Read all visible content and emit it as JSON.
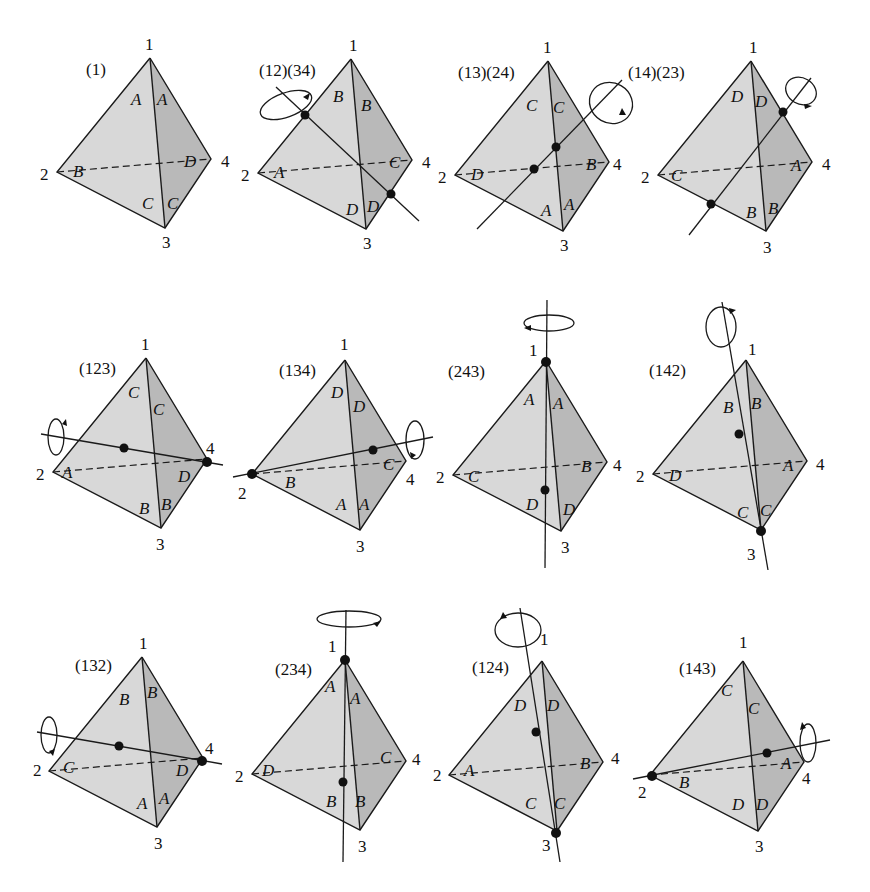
{
  "figure": {
    "vertex_labels": [
      "1",
      "2",
      "3",
      "4"
    ],
    "colors": {
      "left_face": "#d8d8d8",
      "right_face": "#b9b9b9",
      "line": "#1a1a1a",
      "background": "#ffffff"
    },
    "panels": [
      {
        "permutation": "(1)",
        "faces": {
          "upper_left": "A",
          "upper_right": "A",
          "back_left": "B",
          "back_right": "D",
          "lower_left": "C",
          "lower_right": "C"
        },
        "axis": "none"
      },
      {
        "permutation": "(12)(34)",
        "faces": {
          "upper_left": "B",
          "upper_right": "B",
          "back_left": "A",
          "back_right": "C",
          "lower_left": "D",
          "lower_right": "D"
        },
        "axis": "edge-midpoints 12 & 34"
      },
      {
        "permutation": "(13)(24)",
        "faces": {
          "upper_left": "C",
          "upper_right": "C",
          "back_left": "D",
          "back_right": "B",
          "lower_left": "A",
          "lower_right": "A"
        },
        "axis": "edge-midpoints 13 & 24"
      },
      {
        "permutation": "(14)(23)",
        "faces": {
          "upper_left": "D",
          "upper_right": "D",
          "back_left": "C",
          "back_right": "A",
          "lower_left": "B",
          "lower_right": "B"
        },
        "axis": "edge-midpoints 14 & 23"
      },
      {
        "permutation": "(123)",
        "faces": {
          "upper_left": "C",
          "upper_right": "C",
          "back_left": "A",
          "back_right": "D",
          "lower_left": "B",
          "lower_right": "B"
        },
        "axis": "through vertex 4"
      },
      {
        "permutation": "(134)",
        "faces": {
          "upper_left": "D",
          "upper_right": "D",
          "back_left": "B",
          "back_right": "C",
          "lower_left": "A",
          "lower_right": "A"
        },
        "axis": "through vertex 2"
      },
      {
        "permutation": "(243)",
        "faces": {
          "upper_left": "A",
          "upper_right": "A",
          "back_left": "C",
          "back_right": "B",
          "lower_left": "D",
          "lower_right": "D"
        },
        "axis": "through vertex 1"
      },
      {
        "permutation": "(142)",
        "faces": {
          "upper_left": "B",
          "upper_right": "B",
          "back_left": "D",
          "back_right": "A",
          "lower_left": "C",
          "lower_right": "C"
        },
        "axis": "through vertex 3"
      },
      {
        "permutation": "(132)",
        "faces": {
          "upper_left": "B",
          "upper_right": "B",
          "back_left": "C",
          "back_right": "D",
          "lower_left": "A",
          "lower_right": "A"
        },
        "axis": "through vertex 4"
      },
      {
        "permutation": "(234)",
        "faces": {
          "upper_left": "A",
          "upper_right": "A",
          "back_left": "D",
          "back_right": "C",
          "lower_left": "B",
          "lower_right": "B"
        },
        "axis": "through vertex 1"
      },
      {
        "permutation": "(124)",
        "faces": {
          "upper_left": "D",
          "upper_right": "D",
          "back_left": "A",
          "back_right": "B",
          "lower_left": "C",
          "lower_right": "C"
        },
        "axis": "through vertex 3"
      },
      {
        "permutation": "(143)",
        "faces": {
          "upper_left": "C",
          "upper_right": "C",
          "back_left": "B",
          "back_right": "A",
          "lower_left": "D",
          "lower_right": "D"
        },
        "axis": "through vertex 2"
      }
    ]
  }
}
